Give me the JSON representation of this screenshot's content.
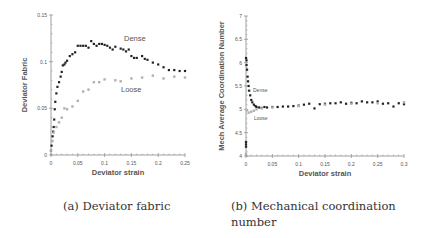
{
  "captions": {
    "a": "(a) Deviator fabric",
    "b_line1": "(b) Mechanical coordination",
    "b_line2": "number"
  },
  "colors": {
    "dense": "#222222",
    "loose": "#b0b0b0",
    "axis": "#888888",
    "text": "#555555"
  },
  "chart_data": [
    {
      "type": "scatter",
      "title": "",
      "xlabel": "Deviator strain",
      "ylabel": "Deviator Fabric",
      "xlim": [
        0,
        0.25
      ],
      "ylim": [
        0,
        0.15
      ],
      "xticks": [
        "0",
        "0.05",
        "0.1",
        "0.15",
        "0.2",
        "0.25"
      ],
      "yticks": [
        "0",
        "0.05",
        "0.1",
        "0.15"
      ],
      "grid": false,
      "annotations": [
        "Dense",
        "Loose"
      ],
      "series": [
        {
          "name": "Dense",
          "x": [
            0,
            0.001,
            0.002,
            0.003,
            0.004,
            0.005,
            0.006,
            0.007,
            0.008,
            0.01,
            0.012,
            0.015,
            0.018,
            0.02,
            0.022,
            0.025,
            0.027,
            0.03,
            0.035,
            0.04,
            0.045,
            0.05,
            0.055,
            0.06,
            0.065,
            0.07,
            0.075,
            0.08,
            0.085,
            0.09,
            0.095,
            0.1,
            0.105,
            0.11,
            0.115,
            0.12,
            0.13,
            0.135,
            0.14,
            0.145,
            0.15,
            0.155,
            0.16,
            0.17,
            0.175,
            0.18,
            0.19,
            0.2,
            0.21,
            0.22,
            0.23,
            0.24,
            0.25
          ],
          "y": [
            0.005,
            0.01,
            0.015,
            0.02,
            0.025,
            0.03,
            0.038,
            0.049,
            0.057,
            0.066,
            0.073,
            0.078,
            0.084,
            0.089,
            0.096,
            0.097,
            0.099,
            0.101,
            0.106,
            0.108,
            0.11,
            0.117,
            0.117,
            0.117,
            0.117,
            0.115,
            0.122,
            0.119,
            0.117,
            0.119,
            0.119,
            0.118,
            0.117,
            0.115,
            0.113,
            0.116,
            0.114,
            0.113,
            0.111,
            0.113,
            0.106,
            0.104,
            0.104,
            0.106,
            0.103,
            0.102,
            0.099,
            0.097,
            0.094,
            0.091,
            0.091,
            0.09,
            0.09
          ]
        },
        {
          "name": "Loose",
          "x": [
            0,
            0.002,
            0.005,
            0.01,
            0.015,
            0.02,
            0.025,
            0.03,
            0.04,
            0.05,
            0.06,
            0.07,
            0.08,
            0.09,
            0.1,
            0.12,
            0.13,
            0.15,
            0.17,
            0.19,
            0.21,
            0.23,
            0.25
          ],
          "y": [
            0.005,
            0.015,
            0.024,
            0.03,
            0.035,
            0.04,
            0.05,
            0.049,
            0.052,
            0.058,
            0.068,
            0.07,
            0.078,
            0.078,
            0.081,
            0.08,
            0.079,
            0.082,
            0.083,
            0.085,
            0.082,
            0.084,
            0.083
          ]
        }
      ]
    },
    {
      "type": "scatter",
      "title": "",
      "xlabel": "Deviator strain",
      "ylabel": "Mech Average Coordination Number",
      "xlim": [
        0,
        0.3
      ],
      "ylim": [
        4,
        7
      ],
      "xticks": [
        "0",
        "0.05",
        "0.1",
        "0.15",
        "0.2",
        "0.25",
        "0.3"
      ],
      "yticks": [
        "4",
        "4.5",
        "5",
        "5.5",
        "6",
        "6.5",
        "7"
      ],
      "grid": false,
      "annotations": [
        "Dense",
        "Loose"
      ],
      "series": [
        {
          "name": "Dense",
          "x": [
            0,
            0,
            0,
            0,
            0.001,
            0.001,
            0.002,
            0.003,
            0.004,
            0.005,
            0.006,
            0.008,
            0.01,
            0.012,
            0.015,
            0.018,
            0.02,
            0.025,
            0.03,
            0.035,
            0.04,
            0.05,
            0.06,
            0.07,
            0.08,
            0.09,
            0.1,
            0.11,
            0.12,
            0.13,
            0.14,
            0.15,
            0.16,
            0.17,
            0.18,
            0.19,
            0.2,
            0.21,
            0.22,
            0.23,
            0.24,
            0.25,
            0.26,
            0.27,
            0.28,
            0.29,
            0.3
          ],
          "y": [
            4.2,
            4.25,
            4.3,
            6.1,
            6.05,
            5.95,
            5.85,
            5.7,
            5.6,
            5.5,
            5.4,
            5.3,
            5.2,
            5.15,
            5.1,
            5.07,
            5.05,
            5.04,
            5.03,
            5.05,
            5.04,
            5.05,
            5.05,
            5.06,
            5.06,
            5.07,
            5.08,
            5.1,
            5.12,
            5.02,
            5.11,
            5.12,
            5.13,
            5.13,
            5.15,
            5.12,
            5.14,
            5.13,
            5.17,
            5.15,
            5.15,
            5.17,
            5.12,
            5.13,
            5.06,
            5.13,
            5.11
          ]
        },
        {
          "name": "Loose",
          "x": [
            0,
            0.002,
            0.005,
            0.01,
            0.015,
            0.02,
            0.03,
            0.05,
            0.1,
            0.15,
            0.2,
            0.25,
            0.3
          ],
          "y": [
            4.05,
            4.98,
            4.93,
            4.95,
            4.97,
            5.0,
            5.02,
            5.04,
            5.07,
            5.1,
            5.12,
            5.13,
            5.15
          ]
        }
      ]
    }
  ]
}
